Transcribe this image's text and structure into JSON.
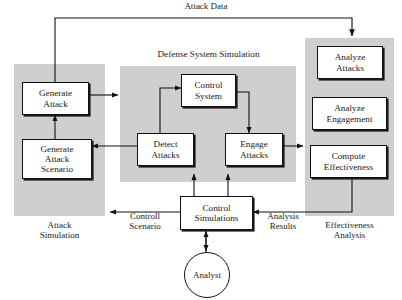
{
  "diagram": {
    "title_flow_label": "Attack Data",
    "panels": [
      {
        "id": "attack-simulation",
        "foot_label": "Attack\nSimulation",
        "title_label": "",
        "color": "#cfcfcf"
      },
      {
        "id": "defense-system-simulation",
        "title_label": "Defense System Simulation",
        "foot_label": "",
        "color": "#cfcfcf"
      },
      {
        "id": "effectiveness-analysis",
        "title_label": "",
        "foot_label": "Effectiveness\nAnalysis",
        "color": "#cfcfcf"
      }
    ],
    "nodes": [
      {
        "id": "generate-attack",
        "label": "Generate\nAttack"
      },
      {
        "id": "generate-attack-scenario",
        "label": "Generate\nAttack\nScenario"
      },
      {
        "id": "control-system",
        "label": "Control\nSystem"
      },
      {
        "id": "detect-attacks",
        "label": "Detect\nAttacks"
      },
      {
        "id": "engage-attacks",
        "label": "Engage\nAttacks"
      },
      {
        "id": "analyze-attacks",
        "label": "Analyze\nAttacks"
      },
      {
        "id": "analyze-engagement",
        "label": "Analyze\nEngagement"
      },
      {
        "id": "compute-effectiveness",
        "label": "Compute\nEffectiveness"
      },
      {
        "id": "control-simulations",
        "label": "Control\nSimulations"
      }
    ],
    "actor": {
      "id": "analyst",
      "label": "Analyst"
    },
    "edge_labels": [
      {
        "id": "attack-data",
        "text": "Attack Data"
      },
      {
        "id": "controll-scenario",
        "text": "Controll\nScenario"
      },
      {
        "id": "analysis-results",
        "text": "Analysis\nResults"
      }
    ],
    "style": {
      "panel_fill": "#cfcfcf",
      "box_fill": "#ffffff",
      "stroke": "#111111",
      "page_bg": "#ffffff"
    }
  }
}
